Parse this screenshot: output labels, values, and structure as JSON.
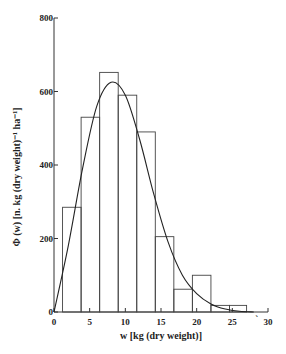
{
  "chart_data": {
    "type": "bar",
    "title": "",
    "xlabel": "w [kg (dry weight)]",
    "ylabel": "Φ (w) [n. kg (dry weight)⁻¹ ha⁻¹]",
    "xlim": [
      0,
      30
    ],
    "ylim": [
      0,
      800
    ],
    "x_ticks": [
      0,
      5,
      10,
      15,
      20,
      25,
      30
    ],
    "y_ticks": [
      0,
      200,
      400,
      600,
      800
    ],
    "grid": false,
    "legend": null,
    "bins": [
      {
        "from": 1.2,
        "to": 3.8,
        "value": 285
      },
      {
        "from": 3.8,
        "to": 6.4,
        "value": 530
      },
      {
        "from": 6.4,
        "to": 9.0,
        "value": 652
      },
      {
        "from": 9.0,
        "to": 11.6,
        "value": 590
      },
      {
        "from": 11.6,
        "to": 14.2,
        "value": 490
      },
      {
        "from": 14.2,
        "to": 16.8,
        "value": 205
      },
      {
        "from": 16.8,
        "to": 19.4,
        "value": 62
      },
      {
        "from": 19.4,
        "to": 22.0,
        "value": 100
      },
      {
        "from": 22.0,
        "to": 24.6,
        "value": 18
      },
      {
        "from": 24.6,
        "to": 27.0,
        "value": 18
      }
    ],
    "fitted_curve": {
      "type": "line",
      "x": [
        0,
        2,
        4,
        6,
        8,
        10,
        12,
        14,
        16,
        18,
        20,
        22,
        24,
        26,
        28
      ],
      "y": [
        0,
        180,
        390,
        560,
        625,
        590,
        470,
        320,
        190,
        100,
        50,
        22,
        8,
        2,
        0
      ]
    },
    "annotations": [
      "`"
    ]
  }
}
